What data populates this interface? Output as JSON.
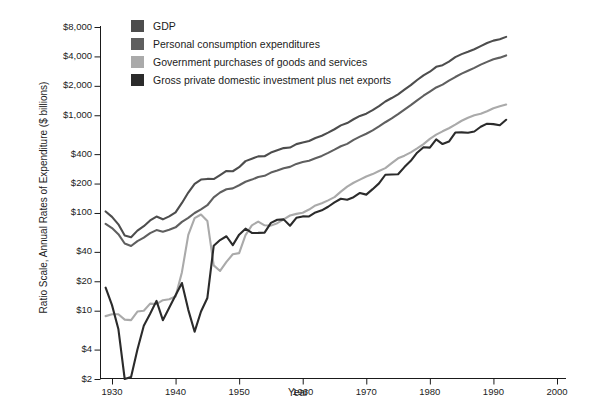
{
  "chart_data": {
    "type": "line",
    "title": "",
    "xlabel": "Year",
    "ylabel": "Ratio Scale, Annual Rates of Expenditure ($ billions)",
    "scale": "log",
    "grid": false,
    "legend_position": "top-left",
    "xlim": [
      1928,
      2000
    ],
    "ylim": [
      2,
      8000
    ],
    "x_ticks": [
      "1930",
      "1940",
      "1950",
      "1960",
      "1970",
      "1980",
      "1990",
      "2000"
    ],
    "x_tick_values": [
      1930,
      1940,
      1950,
      1960,
      1970,
      1980,
      1990,
      2000
    ],
    "y_ticks": [
      "$8,000",
      "$4,000",
      "$2,000",
      "$1,000",
      "$400",
      "$200",
      "$100",
      "$40",
      "$20",
      "$10",
      "$4",
      "$2"
    ],
    "y_tick_values": [
      8000,
      4000,
      2000,
      1000,
      400,
      200,
      100,
      40,
      20,
      10,
      4,
      2
    ],
    "colors": {
      "gdp": "#4d4d4d",
      "personal_consumption": "#5f5f5f",
      "government": "#aaaaaa",
      "investment": "#2b2b2b"
    },
    "x": [
      1929,
      1930,
      1931,
      1932,
      1933,
      1934,
      1935,
      1936,
      1937,
      1938,
      1939,
      1940,
      1941,
      1942,
      1943,
      1944,
      1945,
      1946,
      1947,
      1948,
      1949,
      1950,
      1951,
      1952,
      1953,
      1954,
      1955,
      1956,
      1957,
      1958,
      1959,
      1960,
      1961,
      1962,
      1963,
      1964,
      1965,
      1966,
      1967,
      1968,
      1969,
      1970,
      1971,
      1972,
      1973,
      1974,
      1975,
      1976,
      1977,
      1978,
      1979,
      1980,
      1981,
      1982,
      1983,
      1984,
      1985,
      1986,
      1987,
      1988,
      1989,
      1990,
      1991,
      1992
    ],
    "series": [
      {
        "name": "GDP",
        "key": "gdp",
        "color": "#4d4d4d",
        "values": [
          103.6,
          91.2,
          76.5,
          58.7,
          56.4,
          66.0,
          73.3,
          83.8,
          91.9,
          86.1,
          92.2,
          101.4,
          126.7,
          161.9,
          198.6,
          219.8,
          223.1,
          222.3,
          244.2,
          269.2,
          267.3,
          293.8,
          339.3,
          358.3,
          379.4,
          380.4,
          414.8,
          437.5,
          461.1,
          467.2,
          506.6,
          526.4,
          544.7,
          585.6,
          617.7,
          663.6,
          719.1,
          787.8,
          832.6,
          910.0,
          984.6,
          1038.5,
          1127.1,
          1238.3,
          1382.7,
          1500.0,
          1638.3,
          1825.3,
          2030.9,
          2294.7,
          2563.3,
          2789.5,
          3128.4,
          3255.0,
          3536.7,
          3933.2,
          4220.3,
          4462.8,
          4739.5,
          5103.8,
          5484.4,
          5803.1,
          5995.9,
          6337.7
        ]
      },
      {
        "name": "Personal consumption expenditures",
        "key": "personal_consumption",
        "color": "#5f5f5f",
        "values": [
          77.4,
          70.1,
          60.7,
          48.7,
          45.9,
          51.5,
          55.9,
          62.2,
          66.8,
          64.3,
          67.2,
          71.3,
          81.1,
          89.0,
          99.9,
          108.7,
          120.0,
          144.3,
          162.0,
          174.8,
          178.5,
          192.2,
          208.5,
          219.5,
          233.1,
          240.0,
          258.8,
          271.7,
          286.9,
          296.2,
          317.7,
          331.8,
          342.2,
          363.3,
          383.7,
          411.7,
          444.3,
          481.8,
          509.3,
          559.1,
          603.7,
          646.5,
          700.3,
          767.8,
          848.1,
          927.7,
          1024.9,
          1143.1,
          1271.5,
          1421.2,
          1583.7,
          1748.1,
          1926.2,
          2059.2,
          2257.5,
          2460.3,
          2667.4,
          2850.6,
          3052.2,
          3296.1,
          3517.9,
          3742.6,
          3886.8,
          4095.8
        ]
      },
      {
        "name": "Government purchases of goods and services",
        "key": "government",
        "color": "#aaaaaa",
        "values": [
          8.8,
          9.2,
          9.2,
          8.1,
          8.0,
          9.8,
          10.0,
          11.8,
          11.7,
          12.8,
          13.1,
          14.0,
          24.8,
          59.6,
          88.6,
          96.5,
          82.9,
          29.1,
          25.5,
          31.6,
          37.8,
          38.8,
          59.3,
          74.7,
          81.6,
          74.8,
          74.2,
          78.6,
          86.1,
          94.2,
          97.9,
          100.6,
          108.4,
          119.4,
          126.0,
          134.6,
          145.2,
          165.4,
          185.9,
          203.9,
          219.4,
          236.1,
          249.9,
          268.9,
          287.6,
          323.2,
          362.6,
          385.9,
          416.9,
          457.9,
          507.1,
          572.8,
          633.4,
          684.8,
          735.7,
          800.8,
          878.3,
          942.3,
          997.9,
          1036.9,
          1100.2,
          1181.4,
          1235.5,
          1286.4
        ]
      },
      {
        "name": "Gross private domestic investment plus net exports",
        "key": "investment",
        "color": "#2b2b2b",
        "values": [
          17.2,
          11.4,
          6.5,
          1.8,
          2.1,
          4.0,
          7.0,
          9.3,
          12.6,
          8.0,
          10.7,
          14.4,
          19.2,
          10.2,
          6.1,
          9.8,
          13.5,
          46.1,
          52.8,
          57.8,
          46.9,
          60.0,
          69.1,
          62.4,
          62.5,
          63.0,
          79.1,
          85.2,
          86.0,
          74.0,
          89.2,
          92.2,
          92.1,
          101.2,
          106.5,
          115.8,
          128.1,
          139.8,
          136.6,
          145.0,
          160.2,
          154.1,
          175.2,
          200.9,
          246.1,
          247.7,
          249.3,
          294.8,
          341.5,
          414.0,
          470.9,
          466.4,
          566.8,
          507.6,
          538.1,
          665.2,
          667.4,
          662.5,
          682.4,
          762.2,
          819.8,
          811.7,
          791.1,
          899.1
        ]
      }
    ]
  },
  "legend": {
    "items": [
      {
        "label": "GDP",
        "color": "#4d4d4d",
        "swatch": "solid-gray-medium"
      },
      {
        "label": "Personal consumption expenditures",
        "color": "#5f5f5f",
        "swatch": "solid-gray-dark"
      },
      {
        "label": "Government purchases of goods and services",
        "color": "#aaaaaa",
        "swatch": "solid-gray-light"
      },
      {
        "label": "Gross private domestic investment plus net exports",
        "color": "#2b2b2b",
        "swatch": "solid-gray-darkest"
      }
    ]
  },
  "axes": {
    "y_title": "Ratio Scale, Annual Rates of Expenditure ($ billions)",
    "x_title": "Year"
  }
}
